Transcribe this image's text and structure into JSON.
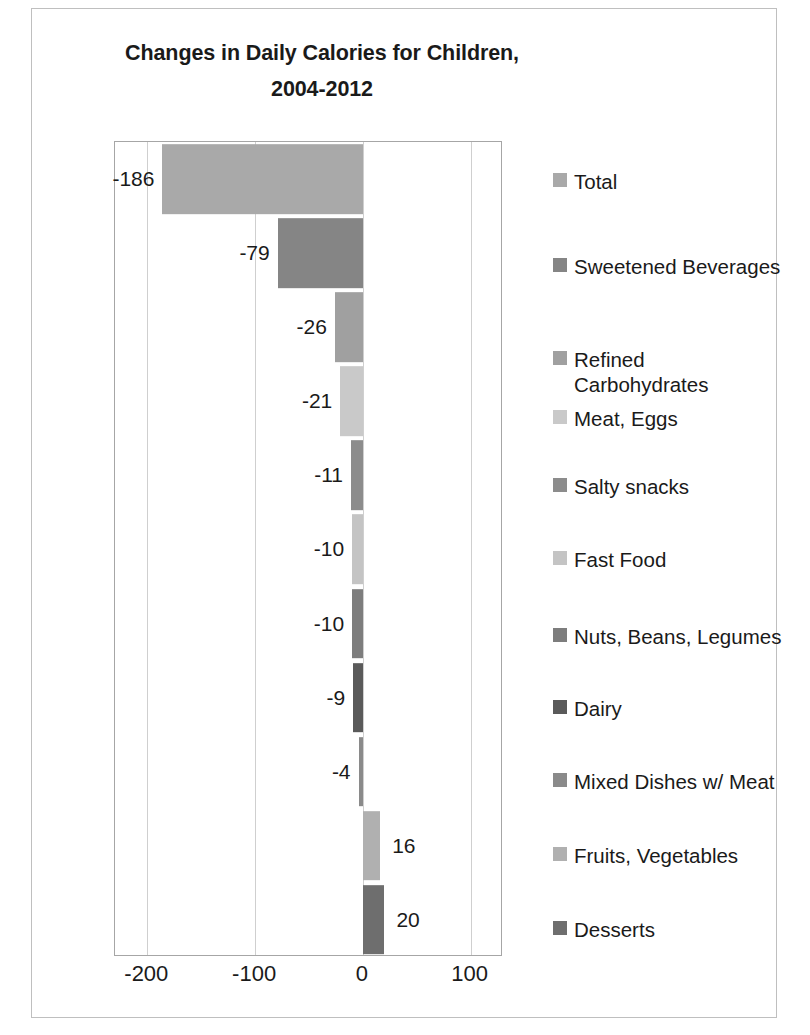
{
  "chart_data": {
    "type": "bar",
    "orientation": "horizontal",
    "title": "Changes in Daily Calories for Children, 2004-2012",
    "title_lines": [
      "Changes in Daily Calories for Children,",
      "2004-2012"
    ],
    "xlabel": "",
    "ylabel": "",
    "xlim": [
      -230,
      130
    ],
    "xticks": [
      -200,
      -100,
      0,
      100
    ],
    "xtick_labels": [
      "-200",
      "-100",
      "0",
      "100"
    ],
    "grid": true,
    "legend_position": "right",
    "categories": [
      "Total",
      "Sweetened Beverages",
      "Refined Carbohydrates",
      "Meat, Eggs",
      "Salty snacks",
      "Fast Food",
      "Nuts, Beans, Legumes",
      "Dairy",
      "Mixed Dishes w/ Meat",
      "Fruits, Vegetables",
      "Desserts"
    ],
    "values": [
      -186,
      -79,
      -26,
      -21,
      -11,
      -10,
      -10,
      -9,
      -4,
      16,
      20
    ],
    "data_labels": [
      "-186",
      "-79",
      "-26",
      "-21",
      "-11",
      "-10",
      "-10",
      "-9",
      "-4",
      "16",
      "20"
    ],
    "colors": [
      "#a9a9a9",
      "#858585",
      "#a0a0a0",
      "#c9c9c9",
      "#8c8c8c",
      "#c4c4c4",
      "#7d7d7d",
      "#5a5a5a",
      "#8a8a8a",
      "#b0b0b0",
      "#6e6e6e"
    ]
  },
  "legend": {
    "items": [
      {
        "label": "Total",
        "color": "#a9a9a9"
      },
      {
        "label": "Sweetened Beverages",
        "color": "#858585"
      },
      {
        "label": "Refined\nCarbohydrates",
        "color": "#a0a0a0"
      },
      {
        "label": "Meat, Eggs",
        "color": "#c9c9c9"
      },
      {
        "label": "Salty snacks",
        "color": "#8c8c8c"
      },
      {
        "label": "Fast Food",
        "color": "#c4c4c4"
      },
      {
        "label": "Nuts, Beans, Legumes",
        "color": "#7d7d7d"
      },
      {
        "label": "Dairy",
        "color": "#5a5a5a"
      },
      {
        "label": "Mixed Dishes w/ Meat",
        "color": "#8a8a8a"
      },
      {
        "label": "Fruits, Vegetables",
        "color": "#b0b0b0"
      },
      {
        "label": "Desserts",
        "color": "#6e6e6e"
      }
    ]
  }
}
